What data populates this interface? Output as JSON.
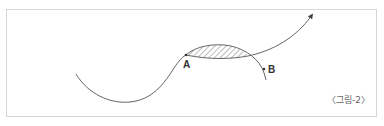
{
  "figure": {
    "caption": "〈그림-2〉",
    "points": [
      {
        "id": "A",
        "label": "A"
      },
      {
        "id": "B",
        "label": "B"
      }
    ],
    "colors": {
      "line": "#555555",
      "frame": "#d6d6d6",
      "hatch": "#777777"
    }
  }
}
